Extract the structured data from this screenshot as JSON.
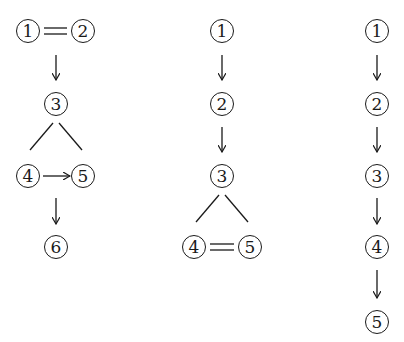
{
  "diagrams": [
    {
      "name": "diagram-1",
      "nodes": [
        {
          "label": "1",
          "x": 28,
          "y": 31
        },
        {
          "label": "2",
          "x": 83,
          "y": 31
        },
        {
          "label": "3",
          "x": 56,
          "y": 104
        },
        {
          "label": "4",
          "x": 28,
          "y": 176
        },
        {
          "label": "5",
          "x": 83,
          "y": 176
        },
        {
          "label": "6",
          "x": 56,
          "y": 247
        }
      ],
      "relations": [
        {
          "from": "1",
          "to": "2",
          "type": "equal"
        },
        {
          "from": "1=2",
          "to": "3",
          "type": "arrow-down"
        },
        {
          "from": "3",
          "to": "4",
          "type": "branch"
        },
        {
          "from": "3",
          "to": "5",
          "type": "branch"
        },
        {
          "from": "4",
          "to": "5",
          "type": "arrow-right"
        },
        {
          "from": "4→5",
          "to": "6",
          "type": "arrow-down"
        }
      ]
    },
    {
      "name": "diagram-2",
      "nodes": [
        {
          "label": "1",
          "x": 222,
          "y": 31
        },
        {
          "label": "2",
          "x": 222,
          "y": 104
        },
        {
          "label": "3",
          "x": 222,
          "y": 176
        },
        {
          "label": "4",
          "x": 194,
          "y": 247
        },
        {
          "label": "5",
          "x": 250,
          "y": 247
        }
      ],
      "relations": [
        {
          "from": "1",
          "to": "2",
          "type": "arrow-down"
        },
        {
          "from": "2",
          "to": "3",
          "type": "arrow-down"
        },
        {
          "from": "3",
          "to": "4",
          "type": "branch"
        },
        {
          "from": "3",
          "to": "5",
          "type": "branch"
        },
        {
          "from": "4",
          "to": "5",
          "type": "equal"
        }
      ]
    },
    {
      "name": "diagram-3",
      "nodes": [
        {
          "label": "1",
          "x": 377,
          "y": 31
        },
        {
          "label": "2",
          "x": 377,
          "y": 104
        },
        {
          "label": "3",
          "x": 377,
          "y": 176
        },
        {
          "label": "4",
          "x": 377,
          "y": 247
        },
        {
          "label": "5",
          "x": 377,
          "y": 322
        }
      ],
      "relations": [
        {
          "from": "1",
          "to": "2",
          "type": "arrow-down"
        },
        {
          "from": "2",
          "to": "3",
          "type": "arrow-down"
        },
        {
          "from": "3",
          "to": "4",
          "type": "arrow-down"
        },
        {
          "from": "4",
          "to": "5",
          "type": "arrow-down"
        }
      ]
    }
  ]
}
